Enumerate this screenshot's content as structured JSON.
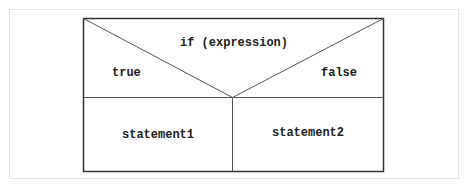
{
  "diagram": {
    "type": "nassi-shneiderman-if",
    "condition": "if (expression)",
    "true_label": "true",
    "false_label": "false",
    "true_branch": "statement1",
    "false_branch": "statement2",
    "colors": {
      "line": "#444444",
      "outer_frame": "#e2e2e2",
      "text": "#222222"
    }
  }
}
